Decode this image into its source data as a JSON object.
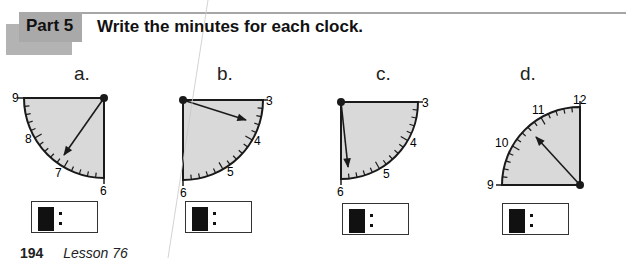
{
  "header": {
    "part_label": "Part 5",
    "instruction": "Write the minutes for each clock."
  },
  "clocks": [
    {
      "letter": "a.",
      "numbers": [
        "9",
        "8",
        "7",
        "6"
      ],
      "hand_target_minute": 37,
      "answer": {
        "hour": "",
        "minutes": ""
      }
    },
    {
      "letter": "b.",
      "numbers": [
        "3",
        "4",
        "5",
        "6"
      ],
      "hand_target_minute": 17,
      "answer": {
        "hour": "",
        "minutes": ""
      }
    },
    {
      "letter": "c.",
      "numbers": [
        "3",
        "4",
        "5",
        "6"
      ],
      "hand_target_minute": 29,
      "answer": {
        "hour": "",
        "minutes": ""
      }
    },
    {
      "letter": "d.",
      "numbers": [
        "12",
        "11",
        "10",
        "9"
      ],
      "hand_target_minute": 52,
      "answer": {
        "hour": "",
        "minutes": ""
      }
    }
  ],
  "footer": {
    "page_number": "194",
    "lesson": "Lesson 76"
  },
  "colors": {
    "dial_fill": "#d9d9d9",
    "tab_gray": "#a9a9a9",
    "ink": "#1a1a1a"
  }
}
